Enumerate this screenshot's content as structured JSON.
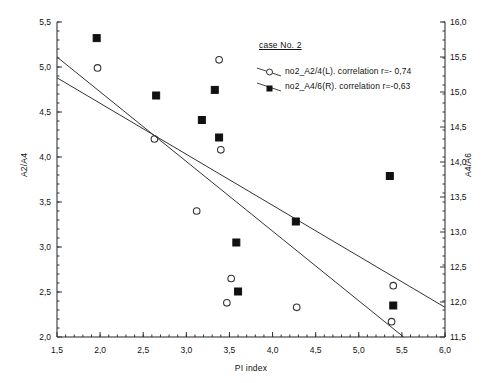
{
  "chart_data": {
    "type": "scatter",
    "title": "case No. 2",
    "xlabel": "PI index",
    "ylabel": "A2/A4",
    "ylabel_right": "A4/A6",
    "xlim": [
      1.5,
      6.0
    ],
    "ylim": [
      2.0,
      5.5
    ],
    "ylim_right": [
      11.5,
      16.0
    ],
    "xticks": [
      "1,5",
      "2,0",
      "2,5",
      "3,0",
      "3,5",
      "4,0",
      "4,5",
      "5,0",
      "5,5",
      "6,0"
    ],
    "xtick_values": [
      1.5,
      2.0,
      2.5,
      3.0,
      3.5,
      4.0,
      4.5,
      5.0,
      5.5,
      6.0
    ],
    "yticks_left": [
      "2,0",
      "2,5",
      "3,0",
      "3,5",
      "4,0",
      "4,5",
      "5,0",
      "5,5"
    ],
    "ytick_values_left": [
      2.0,
      2.5,
      3.0,
      3.5,
      4.0,
      4.5,
      5.0,
      5.5
    ],
    "yticks_right": [
      "11,5",
      "12,0",
      "12,5",
      "13,0",
      "13,5",
      "14,0",
      "14,5",
      "15,0",
      "15,5",
      "16,0"
    ],
    "ytick_values_right": [
      11.5,
      12.0,
      12.5,
      13.0,
      13.5,
      14.0,
      14.5,
      15.0,
      15.5,
      16.0
    ],
    "grid": false,
    "minor_ticks": true,
    "legend_position": "top-right",
    "series": [
      {
        "name": "no2_A2/4(L). correlation r=- 0,74",
        "short_name": "no2_A2/4(L)",
        "axis": "left",
        "marker": "open-circle",
        "correlation": -0.74,
        "points": [
          {
            "x": 1.97,
            "y": 4.99
          },
          {
            "x": 2.63,
            "y": 4.2
          },
          {
            "x": 3.12,
            "y": 3.4
          },
          {
            "x": 3.38,
            "y": 5.08
          },
          {
            "x": 3.4,
            "y": 4.08
          },
          {
            "x": 3.52,
            "y": 2.65
          },
          {
            "x": 3.47,
            "y": 2.38
          },
          {
            "x": 4.28,
            "y": 2.33
          },
          {
            "x": 5.4,
            "y": 2.57
          },
          {
            "x": 5.38,
            "y": 2.17
          }
        ],
        "fit_line": {
          "x1": 1.5,
          "y1": 4.88,
          "x2": 6.0,
          "y2": 2.33
        }
      },
      {
        "name": "no2_A4/6(R). correlation r=-0,63",
        "short_name": "no2_A4/6(R)",
        "axis": "right",
        "marker": "filled-square",
        "correlation": -0.63,
        "points": [
          {
            "x": 1.96,
            "y": 15.77
          },
          {
            "x": 2.65,
            "y": 14.95
          },
          {
            "x": 3.18,
            "y": 14.6
          },
          {
            "x": 3.33,
            "y": 15.03
          },
          {
            "x": 3.38,
            "y": 14.35
          },
          {
            "x": 3.58,
            "y": 12.85
          },
          {
            "x": 3.6,
            "y": 12.15
          },
          {
            "x": 4.27,
            "y": 13.15
          },
          {
            "x": 5.36,
            "y": 13.8
          },
          {
            "x": 5.4,
            "y": 11.95
          }
        ],
        "fit_line": {
          "x1": 1.5,
          "y1": 15.5,
          "x2": 5.52,
          "y2": 11.5
        }
      }
    ]
  },
  "legend": {
    "title": "case No. 2",
    "entries": [
      {
        "label": "no2_A2/4(L). correlation r=- 0,74",
        "marker": "open-circle"
      },
      {
        "label": "no2_A4/6(R). correlation r=-0,63",
        "marker": "filled-square"
      }
    ]
  }
}
